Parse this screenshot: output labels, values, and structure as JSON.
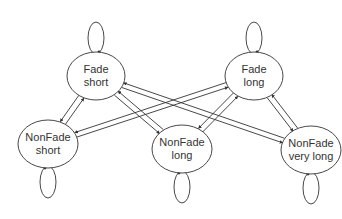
{
  "diagram": {
    "type": "state-transition",
    "colors": {
      "stroke": "#333333",
      "text": "#333333",
      "background": "#ffffff"
    },
    "nodes": [
      {
        "id": "fade_short",
        "line1": "Fade",
        "line2": "short",
        "cx": 96,
        "cy": 76,
        "rx": 29,
        "ry": 24,
        "loop": "top"
      },
      {
        "id": "fade_long",
        "line1": "Fade",
        "line2": "long",
        "cx": 254,
        "cy": 76,
        "rx": 29,
        "ry": 24,
        "loop": "top"
      },
      {
        "id": "nonfade_short",
        "line1": "NonFade",
        "line2": "short",
        "cx": 48,
        "cy": 144,
        "rx": 30,
        "ry": 24,
        "loop": "bottom"
      },
      {
        "id": "nonfade_long",
        "line1": "NonFade",
        "line2": "long",
        "cx": 182,
        "cy": 149,
        "rx": 30,
        "ry": 24,
        "loop": "bottom"
      },
      {
        "id": "nonfade_very_long",
        "line1": "NonFade",
        "line2": "very long",
        "cx": 311,
        "cy": 150,
        "rx": 30,
        "ry": 24,
        "loop": "bottom"
      }
    ],
    "edges": [
      {
        "from": "fade_short",
        "to": "nonfade_short"
      },
      {
        "from": "nonfade_short",
        "to": "fade_short"
      },
      {
        "from": "fade_short",
        "to": "nonfade_long"
      },
      {
        "from": "nonfade_long",
        "to": "fade_short"
      },
      {
        "from": "fade_short",
        "to": "nonfade_very_long"
      },
      {
        "from": "nonfade_very_long",
        "to": "fade_short"
      },
      {
        "from": "fade_long",
        "to": "nonfade_short"
      },
      {
        "from": "nonfade_short",
        "to": "fade_long"
      },
      {
        "from": "fade_long",
        "to": "nonfade_long"
      },
      {
        "from": "nonfade_long",
        "to": "fade_long"
      },
      {
        "from": "fade_long",
        "to": "nonfade_very_long"
      },
      {
        "from": "nonfade_very_long",
        "to": "fade_long"
      },
      {
        "from": "fade_short",
        "to": "fade_short"
      },
      {
        "from": "fade_long",
        "to": "fade_long"
      },
      {
        "from": "nonfade_short",
        "to": "nonfade_short"
      },
      {
        "from": "nonfade_long",
        "to": "nonfade_long"
      },
      {
        "from": "nonfade_very_long",
        "to": "nonfade_very_long"
      }
    ]
  }
}
